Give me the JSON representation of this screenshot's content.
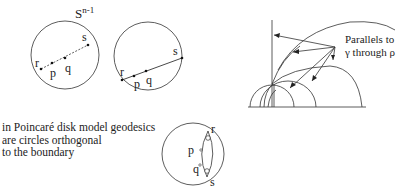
{
  "sphere_label": {
    "base": "S",
    "sup": "n-1"
  },
  "disk1": {
    "points": {
      "r": "r",
      "p": "p",
      "q": "q",
      "s": "s"
    },
    "segment_style": "dashed"
  },
  "disk2": {
    "points": {
      "r": "r",
      "p": "p",
      "q": "q",
      "s": "s"
    },
    "segment_style": "solid"
  },
  "halfplane": {
    "label_line1": "Parallels to",
    "label_line2": "γ through ρ"
  },
  "caption": {
    "line1": "in Poincaré disk model geodesics",
    "line2": "are circles orthogonal",
    "line3": "to the boundary"
  },
  "poincare_disk": {
    "points": {
      "r": "r",
      "p": "p",
      "q": "q",
      "s": "s"
    }
  }
}
